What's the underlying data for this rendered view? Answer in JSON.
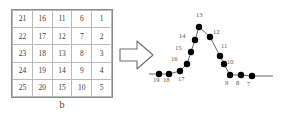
{
  "figure": {
    "caption": "b",
    "arrow_icon": "right-arrow-icon"
  },
  "grid": {
    "rows": 5,
    "cols": 5,
    "cells": [
      [
        "21",
        "16",
        "11",
        "6",
        "1"
      ],
      [
        "22",
        "17",
        "12",
        "7",
        "2"
      ],
      [
        "23",
        "18",
        "13",
        "8",
        "3"
      ],
      [
        "24",
        "19",
        "14",
        "9",
        "4"
      ],
      [
        "25",
        "20",
        "15",
        "10",
        "5"
      ]
    ]
  },
  "chart_data": {
    "type": "line",
    "title": "",
    "xlabel": "",
    "ylabel": "",
    "grid": false,
    "legend": null,
    "xlim": [
      0,
      142
    ],
    "ylim": [
      0,
      110
    ],
    "marker": "filled-circle",
    "point_labels": [
      "19",
      "18",
      "17",
      "16",
      "15",
      "14",
      "13",
      "12",
      "11",
      "10",
      "9",
      "8",
      "7"
    ],
    "points": [
      {
        "label": "19",
        "x": 17,
        "y": 72,
        "label_dx": -3,
        "label_dy": 6
      },
      {
        "label": "18",
        "x": 27,
        "y": 72,
        "label_dx": -3,
        "label_dy": 6
      },
      {
        "label": "17",
        "x": 38,
        "y": 69,
        "label_dx": 1,
        "label_dy": 8
      },
      {
        "label": "16",
        "x": 45,
        "y": 62,
        "label_dx": -13,
        "label_dy": -5
      },
      {
        "label": "15",
        "x": 49,
        "y": 50,
        "label_dx": -13,
        "label_dy": -4
      },
      {
        "label": "14",
        "x": 53,
        "y": 38,
        "label_dx": -13,
        "label_dy": -4
      },
      {
        "label": "13",
        "x": 57,
        "y": 25,
        "label_dx": 0,
        "label_dy": -12
      },
      {
        "label": "12",
        "x": 68,
        "y": 35,
        "label_dx": 6,
        "label_dy": -5
      },
      {
        "label": "11",
        "x": 78,
        "y": 54,
        "label_dx": 4,
        "label_dy": -10
      },
      {
        "label": "10",
        "x": 82,
        "y": 62,
        "label_dx": 6,
        "label_dy": -2
      },
      {
        "label": "9",
        "x": 88,
        "y": 73,
        "label_dx": -2,
        "label_dy": 8
      },
      {
        "label": "8",
        "x": 99,
        "y": 73,
        "label_dx": -2,
        "label_dy": 8
      },
      {
        "label": "7",
        "x": 110,
        "y": 74,
        "label_dx": -2,
        "label_dy": 8
      }
    ],
    "tail_line": {
      "from_x": 110,
      "from_y": 74,
      "to_x": 131,
      "to_y": 74
    },
    "head_line": {
      "from_x": 7,
      "from_y": 72,
      "to_x": 17,
      "to_y": 72
    },
    "colors": {
      "marker": "#000000",
      "line": "#555555"
    }
  }
}
